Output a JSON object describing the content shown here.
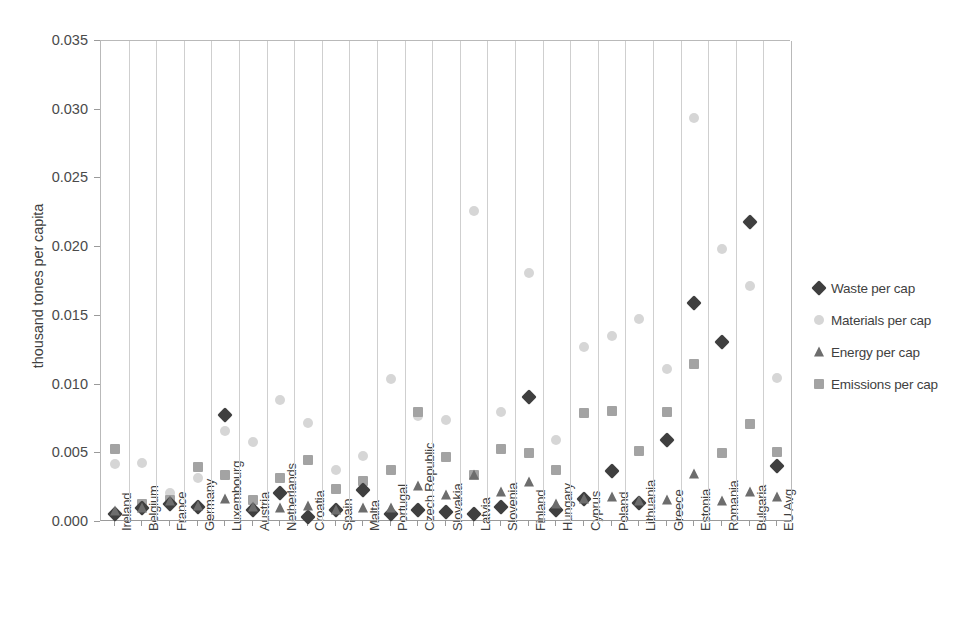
{
  "chart_data": {
    "type": "scatter",
    "title": "",
    "xlabel": "",
    "ylabel": "thousand tones per capita",
    "ylim": [
      0,
      0.035
    ],
    "ytick_labels": [
      "0.000",
      "0.005",
      "0.010",
      "0.015",
      "0.020",
      "0.025",
      "0.030",
      "0.035"
    ],
    "ytick_values": [
      0,
      0.005,
      0.01,
      0.015,
      0.02,
      0.025,
      0.03,
      0.035
    ],
    "grid": "vertical",
    "legend_position": "right",
    "categories": [
      "Ireland",
      "Belgium",
      "France",
      "Germany",
      "Luxembourg",
      "Austria",
      "Netherlands",
      "Croatia",
      "Spain",
      "Malta",
      "Portugal",
      "Czech Republic",
      "Slovakia",
      "Latvia",
      "Slovenia",
      "Finland",
      "Hungary",
      "Cyprus",
      "Poland",
      "Lithuania",
      "Greece",
      "Estonia",
      "Romania",
      "Bulgaria",
      "EU Avg"
    ],
    "series": [
      {
        "name": "Waste per cap",
        "marker": "diamond",
        "color": "#3f3f3f",
        "values": [
          0.0006,
          0.001,
          0.0013,
          0.0011,
          0.0078,
          0.0009,
          0.0021,
          0.0004,
          0.0009,
          0.0023,
          0.0006,
          0.0009,
          0.0007,
          0.0006,
          0.0011,
          0.0091,
          0.0009,
          0.0017,
          0.0037,
          0.0014,
          0.006,
          0.0159,
          0.0131,
          0.0218,
          0.0041
        ]
      },
      {
        "name": "Materials per cap",
        "marker": "circle",
        "color": "#d6d6d6",
        "values": [
          0.0042,
          0.0043,
          0.0021,
          0.0032,
          0.0066,
          0.0058,
          0.0089,
          0.0072,
          0.0038,
          0.0048,
          0.0104,
          0.0077,
          0.0074,
          0.0226,
          0.008,
          0.0181,
          0.006,
          0.0127,
          0.0135,
          0.0148,
          0.0111,
          0.0294,
          0.0199,
          0.0172,
          0.0105
        ]
      },
      {
        "name": "Energy per cap",
        "marker": "triangle",
        "color": "#6d6d6d",
        "values": [
          0.0008,
          0.001,
          0.0015,
          0.0012,
          0.0017,
          0.0011,
          0.001,
          0.0012,
          0.0009,
          0.001,
          0.001,
          0.0026,
          0.002,
          0.0034,
          0.0022,
          0.0029,
          0.0013,
          0.0017,
          0.0018,
          0.0015,
          0.0016,
          0.0035,
          0.0015,
          0.0022,
          0.0018
        ]
      },
      {
        "name": "Emissions per cap",
        "marker": "square",
        "color": "#a3a3a3",
        "values": [
          0.0053,
          0.0013,
          0.0016,
          0.004,
          0.0034,
          0.0016,
          0.0032,
          0.0045,
          0.0024,
          0.003,
          0.0038,
          0.008,
          0.0047,
          0.0034,
          0.0053,
          0.005,
          0.0038,
          0.0079,
          0.0081,
          0.0052,
          0.008,
          0.0115,
          0.005,
          0.0071,
          0.0051
        ]
      }
    ]
  },
  "legend": {
    "items": [
      {
        "label": "Waste per cap",
        "marker": "diamond",
        "color": "#3f3f3f"
      },
      {
        "label": "Materials per cap",
        "marker": "circle",
        "color": "#d6d6d6"
      },
      {
        "label": "Energy per cap",
        "marker": "triangle",
        "color": "#6d6d6d"
      },
      {
        "label": "Emissions per cap",
        "marker": "square",
        "color": "#a3a3a3"
      }
    ]
  }
}
